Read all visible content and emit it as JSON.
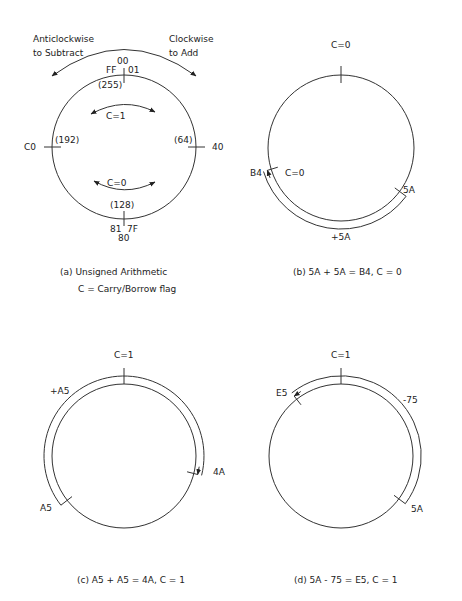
{
  "panels": {
    "a": {
      "caption": "(a)  Unsigned Arithmetic",
      "subcaption": "C = Carry/Borrow flag",
      "anticlockwise_label_1": "Anticlockwise",
      "anticlockwise_label_2": "to Subtract",
      "clockwise_label_1": "Clockwise",
      "clockwise_label_2": "to Add",
      "top_hex": "00",
      "top_left_hex": "FF",
      "top_right_hex": "01",
      "top_dec": "(255)",
      "left_hex": "C0",
      "left_dec": "(192)",
      "right_hex": "40",
      "right_dec": "(64)",
      "bottom_hex": "80",
      "bottom_left_hex": "81",
      "bottom_right_hex": "7F",
      "bottom_dec": "(128)",
      "upper_flag": "C=1",
      "lower_flag": "C=0"
    },
    "b": {
      "caption": "(b)  5A + 5A = B4,  C = 0",
      "top_flag": "C=0",
      "start_label": "5A",
      "end_label": "B4",
      "end_flag": "C=0",
      "operation": "+5A",
      "start_value": 90,
      "end_value": 180,
      "direction": "clockwise"
    },
    "c": {
      "caption": "(c)  A5 + A5 = 4A,  C = 1",
      "top_flag": "C=1",
      "start_label": "A5",
      "end_label": "4A",
      "operation": "+A5",
      "start_value": 165,
      "end_value": 330,
      "direction": "clockwise"
    },
    "d": {
      "caption": "(d)  5A - 75 = E5,  C = 1",
      "top_flag": "C=1",
      "start_label": "5A",
      "end_label": "E5",
      "operation": "-75",
      "start_value": 90,
      "end_value": -27,
      "direction": "anticlockwise"
    }
  },
  "modulus": 256
}
